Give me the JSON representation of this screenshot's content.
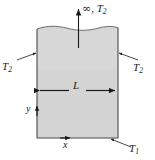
{
  "figure": {
    "background_color": "#ffffff",
    "body": {
      "name": "semi-infinite-solid",
      "fill_color": "#d4d4d4",
      "edge_color": "#4a4a4a",
      "top_edge_style": "wavy-break-line",
      "x_left": 37,
      "x_right": 118,
      "y_top": 27,
      "y_bottom": 138
    },
    "labels": {
      "top": {
        "infinity": "∞",
        "comma": ",",
        "temp": "T",
        "temp_sub": "2",
        "full": "∞, T2"
      },
      "left": {
        "temp": "T",
        "temp_sub": "2",
        "full": "T2"
      },
      "right": {
        "temp": "T",
        "temp_sub": "2",
        "full": "T2"
      },
      "bottom": {
        "temp": "T",
        "temp_sub": "1",
        "full": "T1"
      },
      "width": {
        "symbol": "L"
      },
      "axis_y": {
        "symbol": "y"
      },
      "axis_x": {
        "symbol": "x"
      }
    },
    "annotations": {
      "vertical_arrow": "arrow pointing up to infinity",
      "dimension_arrow": "double-headed horizontal arrow labeled L",
      "leader_lines": 3,
      "axis_arrow_y": "small arrowhead pointing up on left edge",
      "axis_arrow_x": "small arrowhead pointing right on bottom edge"
    }
  }
}
